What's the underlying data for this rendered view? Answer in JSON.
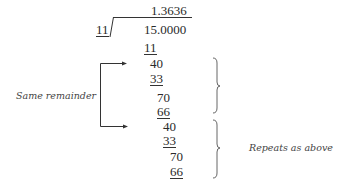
{
  "division": {
    "divisor": "11",
    "dividend": "15.0000",
    "quotient": "1.3636",
    "steps": [
      {
        "value": "11",
        "underlined": true
      },
      {
        "value": "40",
        "underlined": false
      },
      {
        "value": "33",
        "underlined": true
      },
      {
        "value": "70",
        "underlined": false
      },
      {
        "value": "66",
        "underlined": true
      },
      {
        "value": "40",
        "underlined": false
      },
      {
        "value": "33",
        "underlined": true
      },
      {
        "value": "70",
        "underlined": false
      },
      {
        "value": "66",
        "underlined": true
      }
    ]
  },
  "annotations": {
    "left_label": "Same remainder",
    "right_label": "Repeats as above"
  }
}
